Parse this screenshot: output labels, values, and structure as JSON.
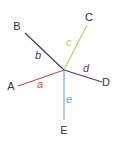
{
  "diagram": {
    "center": {
      "x": 64,
      "y": 70
    },
    "nodes": [
      {
        "id": "A",
        "label": "A",
        "x": 18,
        "y": 86,
        "lx": 11,
        "ly": 90
      },
      {
        "id": "B",
        "label": "B",
        "x": 25,
        "y": 33,
        "lx": 17,
        "ly": 30
      },
      {
        "id": "C",
        "label": "C",
        "x": 87,
        "y": 25,
        "lx": 89,
        "ly": 21
      },
      {
        "id": "D",
        "label": "D",
        "x": 102,
        "y": 82,
        "lx": 106,
        "ly": 86
      },
      {
        "id": "E",
        "label": "E",
        "x": 64,
        "y": 120,
        "lx": 64,
        "ly": 134
      }
    ],
    "edges": [
      {
        "label": "a",
        "to": "A",
        "color": "#c0504d",
        "lx": 40,
        "ly": 88
      },
      {
        "label": "b",
        "to": "B",
        "color": "#3d3a66",
        "lx": 38,
        "ly": 59
      },
      {
        "label": "c",
        "to": "C",
        "color": "#c8c86a",
        "lx": 69,
        "ly": 46
      },
      {
        "label": "d",
        "to": "D",
        "color": "#5a3a66",
        "lx": 86,
        "ly": 72
      },
      {
        "label": "e",
        "to": "E",
        "color": "#6aa8d8",
        "lx": 69,
        "ly": 103
      }
    ]
  }
}
